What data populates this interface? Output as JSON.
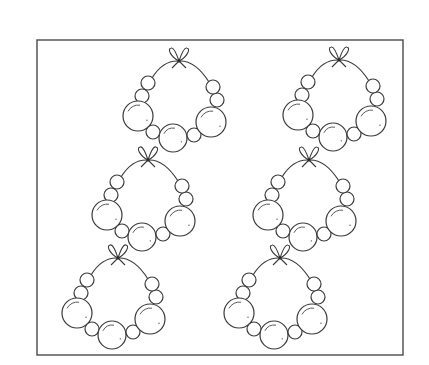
{
  "colors": {
    "background": "#ffffff",
    "line": "#3a3a3a",
    "frame": "#4a4a4a"
  },
  "frame": {
    "x": 37,
    "y": 40,
    "width": 366,
    "height": 315
  },
  "necklace_template": {
    "beads": [
      {
        "name": "left-small-upper",
        "dx": -31,
        "dy": 22,
        "r": 7
      },
      {
        "name": "left-small-middle",
        "dx": -37,
        "dy": 35,
        "r": 7
      },
      {
        "name": "left-large",
        "dx": -41,
        "dy": 55,
        "r": 15
      },
      {
        "name": "left-small-lower",
        "dx": -26,
        "dy": 71,
        "r": 7
      },
      {
        "name": "center-large",
        "dx": -6,
        "dy": 77,
        "r": 14
      },
      {
        "name": "right-small-lower",
        "dx": 15,
        "dy": 74,
        "r": 7
      },
      {
        "name": "right-large",
        "dx": 32,
        "dy": 61,
        "r": 15
      },
      {
        "name": "right-small-middle",
        "dx": 38,
        "dy": 39,
        "r": 7
      },
      {
        "name": "right-small-upper",
        "dx": 34,
        "dy": 26,
        "r": 7
      }
    ]
  },
  "necklaces": [
    {
      "id": 1,
      "label": "necklace-top-left",
      "bow": {
        "x": 179,
        "y": 61
      }
    },
    {
      "id": 2,
      "label": "necklace-top-right",
      "bow": {
        "x": 339,
        "y": 60
      }
    },
    {
      "id": 3,
      "label": "necklace-middle-left",
      "bow": {
        "x": 148,
        "y": 160
      }
    },
    {
      "id": 4,
      "label": "necklace-middle-right",
      "bow": {
        "x": 309,
        "y": 160
      }
    },
    {
      "id": 5,
      "label": "necklace-bottom-left",
      "bow": {
        "x": 118,
        "y": 258
      }
    },
    {
      "id": 6,
      "label": "necklace-bottom-right",
      "bow": {
        "x": 280,
        "y": 258
      }
    }
  ]
}
